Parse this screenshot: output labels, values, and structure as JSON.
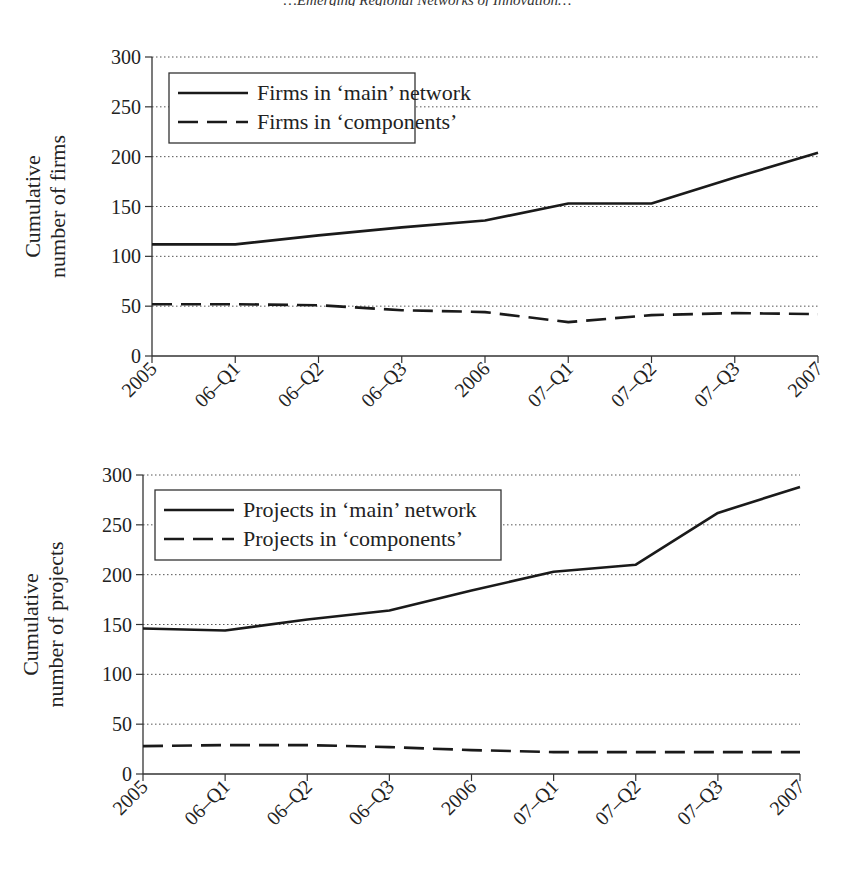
{
  "page": {
    "header_fragment": "…Emerging Regional Networks of Innovation…"
  },
  "chart_data": [
    {
      "type": "line",
      "title": "",
      "xlabel": "",
      "ylabel": "Cumulative number of firms",
      "ylabel_lines": [
        "Cumulative",
        "number of firms"
      ],
      "ylim": [
        0,
        300
      ],
      "yticks": [
        0,
        50,
        100,
        150,
        200,
        250,
        300
      ],
      "grid": "horizontal dotted",
      "legend_position": "upper left (boxed)",
      "categories": [
        "2005",
        "06–Q1",
        "06–Q2",
        "06–Q3",
        "2006",
        "07–Q1",
        "07–Q2",
        "07–Q3",
        "2007"
      ],
      "series": [
        {
          "name": "Firms in ‘main’ network",
          "style": "solid",
          "values": [
            112,
            112,
            121,
            129,
            136,
            153,
            153,
            179,
            204
          ]
        },
        {
          "name": "Firms in ‘components’",
          "style": "dashed",
          "values": [
            52,
            52,
            51,
            46,
            44,
            34,
            41,
            43,
            42
          ]
        }
      ]
    },
    {
      "type": "line",
      "title": "",
      "xlabel": "",
      "ylabel": "Cumulative number of projects",
      "ylabel_lines": [
        "Cumulative",
        "number of projects"
      ],
      "ylim": [
        0,
        300
      ],
      "yticks": [
        0,
        50,
        100,
        150,
        200,
        250,
        300
      ],
      "grid": "horizontal dotted",
      "legend_position": "upper left (boxed)",
      "categories": [
        "2005",
        "06–Q1",
        "06–Q2",
        "06–Q3",
        "2006",
        "07–Q1",
        "07–Q2",
        "07–Q3",
        "2007"
      ],
      "series": [
        {
          "name": "Projects in ‘main’ network",
          "style": "solid",
          "values": [
            146,
            144,
            155,
            164,
            184,
            203,
            210,
            262,
            288
          ]
        },
        {
          "name": "Projects in ‘components’",
          "style": "dashed",
          "values": [
            28,
            29,
            29,
            27,
            24,
            22,
            22,
            22,
            22
          ]
        }
      ]
    }
  ],
  "colors": {
    "line": "#1a1a1a",
    "grid": "#555555",
    "axis": "#333333"
  }
}
